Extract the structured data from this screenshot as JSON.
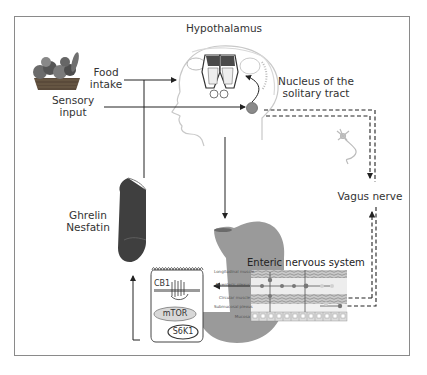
{
  "figure": {
    "labels": {
      "hypothalamus": "Hypothalamus",
      "food_intake": [
        "Food",
        "intake"
      ],
      "sensory_input": [
        "Sensory",
        "input"
      ],
      "nts": [
        "Nucleus of the",
        "solitary tract"
      ],
      "ghrelin_nesfatin": [
        "Ghrelin",
        "Nesfatin"
      ],
      "vagus_nerve": "Vagus nerve",
      "enteric_nervous_system": "Enteric nervous system",
      "cell": {
        "receptor": "CB1",
        "kinase1": "mTOR",
        "kinase2": "S6K1"
      },
      "gut_wall_layers": [
        "Longitudinal muscle",
        "Myenteric plexus",
        "Circular muscle",
        "Submucosal plexus",
        "Mucosa"
      ]
    },
    "images": {
      "food_basket": "fruit-basket-illustration",
      "brain": "head-with-hypothalamus-illustration",
      "neuron": "vagal-neuron-illustration",
      "stomach": "stomach-illustration",
      "stomach_section": "stomach-tissue-section-illustration",
      "gut_wall": "gut-wall-cross-section-illustration",
      "endocrine_cell": "enteroendocrine-cell-illustration"
    },
    "colors": {
      "frame": "#8a8a8a",
      "text": "#333333",
      "arrow": "#222222",
      "stomach": "#9a9a9a",
      "tissue": "#4a4a4a"
    }
  }
}
